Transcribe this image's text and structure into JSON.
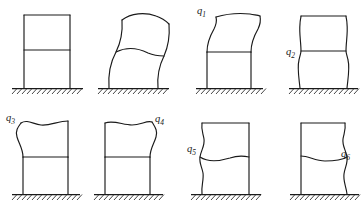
{
  "figure": {
    "stroke_color": "#1a1a1a",
    "background_color": "#ffffff",
    "ground_hatch_count": 14
  },
  "panels": [
    {
      "id": "panel-undeformed",
      "name": "undeformed-frame",
      "label": "",
      "label_visible": false,
      "row": 1,
      "column": 1,
      "shape": "rectangular two-story frame, undeformed reference configuration"
    },
    {
      "id": "panel-swayed",
      "name": "swayed-frame",
      "label": "",
      "label_visible": false,
      "row": 1,
      "column": 2,
      "shape": "two-story frame leaning to the right with curved columns, total deflected shape"
    },
    {
      "id": "panel-q1",
      "name": "mode-frame-q1",
      "label": "q",
      "subscript": "1",
      "label_visible": true,
      "label_x": 197,
      "label_y": 12,
      "row": 1,
      "column": 3,
      "shape": "upper story sways right with S-curved columns; lower story remains rectangular"
    },
    {
      "id": "panel-q2",
      "name": "mode-frame-q2",
      "label": "q",
      "subscript": "2",
      "label_visible": true,
      "label_x": 286,
      "label_y": 53,
      "row": 1,
      "column": 4,
      "shape": "both stories bow, columns pinch inward at the mid-height beam"
    },
    {
      "id": "panel-q3",
      "name": "mode-frame-q3",
      "label": "q",
      "subscript": "3",
      "label_visible": true,
      "label_x": 6,
      "label_y": 119,
      "row": 2,
      "column": 1,
      "shape": "upper story left column bulges outward to the left; lower story rectangular"
    },
    {
      "id": "panel-q4",
      "name": "mode-frame-q4",
      "label": "q",
      "subscript": "4",
      "label_visible": true,
      "label_x": 155,
      "label_y": 120,
      "row": 2,
      "column": 2,
      "shape": "upper story right column bulges outward to the right; lower story rectangular"
    },
    {
      "id": "panel-q5",
      "name": "mode-frame-q5",
      "label": "q",
      "subscript": "5",
      "label_visible": true,
      "label_x": 187,
      "label_y": 150,
      "row": 2,
      "column": 3,
      "shape": "left column wavy over full height with mid beam sagging; right column straight"
    },
    {
      "id": "panel-q6",
      "name": "mode-frame-q6",
      "label": "q",
      "subscript": "6",
      "label_visible": true,
      "label_x": 341,
      "label_y": 155,
      "row": 2,
      "column": 4,
      "shape": "right column wavy over full height with mid beam sagging; left column straight"
    }
  ]
}
